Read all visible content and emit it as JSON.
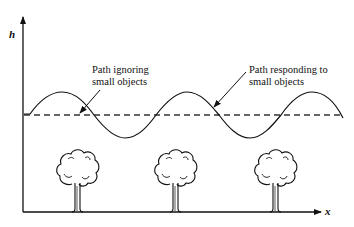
{
  "diagram": {
    "axes": {
      "y_label": "h",
      "x_label": "x"
    },
    "annotations": [
      {
        "line1": "Path ignoring",
        "line2": "small objects"
      },
      {
        "line1": "Path responding to",
        "line2": "small objects"
      }
    ],
    "series": [
      {
        "name": "Path ignoring small objects",
        "style": "dashed",
        "shape": "straight line"
      },
      {
        "name": "Path responding to small objects",
        "style": "solid",
        "shape": "sinusoid"
      }
    ],
    "objects": [
      {
        "type": "tree",
        "position": 1
      },
      {
        "type": "tree",
        "position": 2
      },
      {
        "type": "tree",
        "position": 3
      }
    ],
    "colors": {
      "ink": "#111111",
      "background": "#ffffff"
    }
  }
}
